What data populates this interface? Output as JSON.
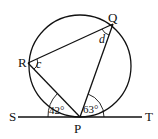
{
  "diagram": {
    "type": "circle-geometry",
    "points": {
      "P": {
        "label": "P",
        "x": 80,
        "y": 117
      },
      "Q": {
        "label": "Q",
        "x": 113,
        "y": 24
      },
      "R": {
        "label": "R",
        "x": 28,
        "y": 63
      },
      "S": {
        "label": "S",
        "x": 12,
        "y": 117
      },
      "T": {
        "label": "T",
        "x": 150,
        "y": 117
      }
    },
    "circle": {
      "cx": 80,
      "cy": 66,
      "r": 52
    },
    "angles": {
      "SPR": "42°",
      "QPT": "63°",
      "c": "c",
      "d": "d"
    },
    "tangent_line": "ST",
    "stroke_color": "#111111"
  }
}
